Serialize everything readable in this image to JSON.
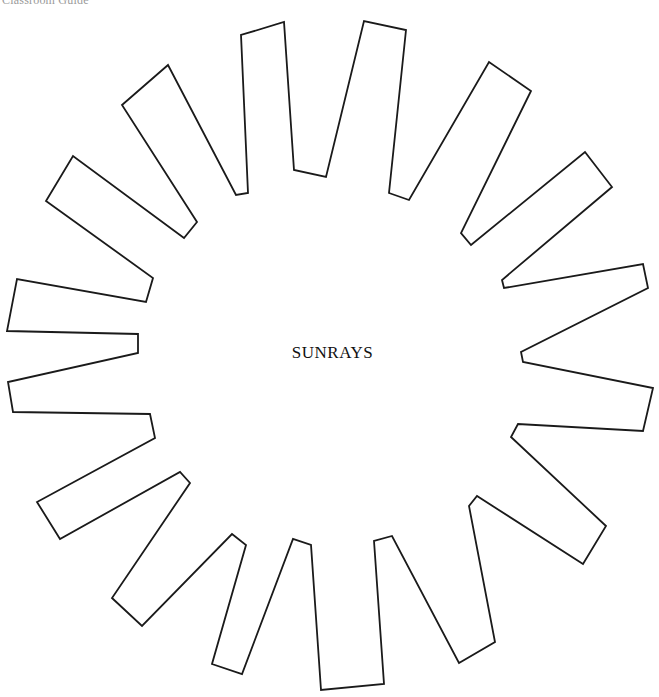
{
  "header": {
    "text": "Classroom Guide"
  },
  "figure": {
    "title": "SUNRAYS",
    "stroke_color": "#1a1a1a",
    "fill_color": "#ffffff",
    "ray_count": 18,
    "outline_points": "122,105 168,65 236,195 248,193 241,35 284,22 294,170 326,177 364,21 406,30 389,193 409,200 489,62 531,91 461,233 471,245 585,152 612,187 502,280 504,288 643,264 648,288 521,352 523,362 653,388 643,431 518,424 511,437 606,526 583,564 477,496 469,506 495,642 459,663 392,536 374,541 384,684 321,690 311,545 293,539 242,674 212,664 246,545 232,534 142,626 112,598 190,483 180,472 60,539 37,502 155,438 150,414 13,412 8,382 138,353 138,334 7,331 17,279 146,302 153,278 46,201 73,156 184,238 197,222"
  }
}
